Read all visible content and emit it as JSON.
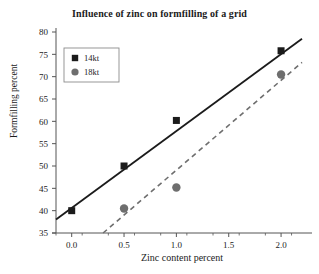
{
  "chart_data": {
    "type": "scatter",
    "title": "Influence of zinc on formfilling of a grid",
    "xlabel": "Zinc content percent",
    "ylabel": "Formfilling percent",
    "xlim": [
      -0.15,
      2.2
    ],
    "ylim": [
      35,
      80
    ],
    "xticks": [
      "0.0",
      "0.5",
      "1.0",
      "1.5",
      "2.0"
    ],
    "xtick_values": [
      0.0,
      0.5,
      1.0,
      1.5,
      2.0
    ],
    "yticks": [
      "35",
      "40",
      "45",
      "50",
      "55",
      "60",
      "65",
      "70",
      "75",
      "80"
    ],
    "ytick_values": [
      35,
      40,
      45,
      50,
      55,
      60,
      65,
      70,
      75,
      80
    ],
    "grid": false,
    "legend_position": "upper-left",
    "series": [
      {
        "name": "14kt",
        "marker": "square",
        "color": "#1b1b1b",
        "line_style": "solid",
        "x": [
          0.0,
          0.5,
          1.0,
          2.0
        ],
        "values": [
          40.0,
          50.0,
          60.2,
          75.8
        ],
        "fit_x": [
          -0.15,
          2.2
        ],
        "fit_y": [
          38.0,
          78.5
        ]
      },
      {
        "name": "18kt",
        "marker": "circle",
        "color": "#6e6e6e",
        "line_style": "dashed",
        "x": [
          0.5,
          1.0,
          2.0
        ],
        "values": [
          40.5,
          45.2,
          70.5
        ],
        "fit_x": [
          0.3,
          2.2
        ],
        "fit_y": [
          35.0,
          73.2
        ]
      }
    ]
  },
  "legend": {
    "items": [
      {
        "label": "14kt",
        "marker": "square",
        "color": "#1b1b1b"
      },
      {
        "label": "18kt",
        "marker": "circle",
        "color": "#6e6e6e"
      }
    ]
  },
  "axes": {
    "axis_color": "#555555",
    "background": "#ffffff"
  }
}
